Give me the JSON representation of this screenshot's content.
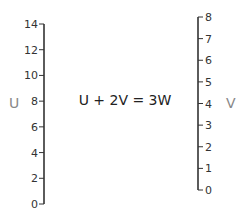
{
  "diagram": {
    "type": "nomogram",
    "equation": "U + 2V = 3W",
    "axes": [
      {
        "name": "U",
        "side": "left",
        "min": 0,
        "max": 14,
        "ticks": [
          0,
          2,
          4,
          6,
          8,
          10,
          12,
          14
        ],
        "tick_labels": [
          "0",
          "2",
          "4",
          "6",
          "8",
          "10",
          "12",
          "14"
        ]
      },
      {
        "name": "V",
        "side": "right",
        "min": 0,
        "max": 8,
        "ticks": [
          0,
          1,
          2,
          3,
          4,
          5,
          6,
          7,
          8
        ],
        "tick_labels": [
          "0",
          "1",
          "2",
          "3",
          "4",
          "5",
          "6",
          "7",
          "8"
        ]
      }
    ]
  },
  "colors": {
    "axis_line": "#333333",
    "tick_text": "#333333",
    "axis_name": "#888888",
    "equation_text": "#222222"
  }
}
